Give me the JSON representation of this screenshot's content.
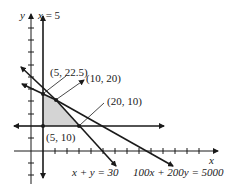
{
  "figure": {
    "axis_labels": {
      "x": "x",
      "y": "y"
    },
    "lines": [
      {
        "id": "x5",
        "label_var": "x",
        "label_rest": " = 5"
      },
      {
        "id": "xy30",
        "label": "x + y = 30"
      },
      {
        "id": "budget",
        "label": "100x + 200y = 5000"
      },
      {
        "id": "y10"
      }
    ],
    "vertices": [
      {
        "label": "(5, 22.5)"
      },
      {
        "label": "(10, 20)"
      },
      {
        "label": "(20, 10)"
      },
      {
        "label": "(5, 10)"
      }
    ],
    "feasible_region_color": "#d4d4d4",
    "line_color": "#1a1a1a"
  }
}
